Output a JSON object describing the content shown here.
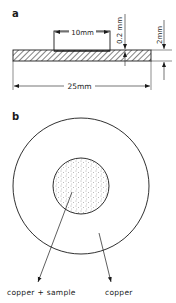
{
  "panel_a": {
    "label": "a",
    "dim_sample_width": "10mm",
    "dim_sample_thickness": "0.2 mm",
    "dim_base_thickness": "2mm",
    "dim_base_width": "25mm"
  },
  "panel_b": {
    "label": "b",
    "inner_label": "copper + sample",
    "outer_label": "copper"
  },
  "colors": {
    "line": "#1a1a1a",
    "background": "#ffffff"
  }
}
